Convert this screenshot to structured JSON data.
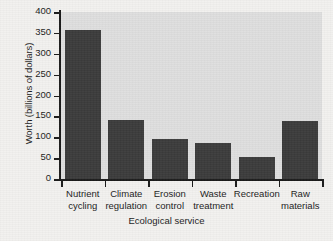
{
  "chart_data": {
    "type": "bar",
    "title": "",
    "xlabel": "Ecological service",
    "ylabel": "Worth (billions of dollars)",
    "categories": [
      "Nutrient cycling",
      "Climate regulation",
      "Erosion control",
      "Waste treatment",
      "Recreation",
      "Raw materials"
    ],
    "category_lines": [
      [
        "Nutrient",
        "cycling"
      ],
      [
        "Climate",
        "regulation"
      ],
      [
        "Erosion",
        "control"
      ],
      [
        "Waste",
        "treatment"
      ],
      [
        "Recreation",
        ""
      ],
      [
        "Raw",
        "materials"
      ]
    ],
    "values": [
      357,
      141,
      96,
      86,
      53,
      139
    ],
    "ylim": [
      0,
      400
    ],
    "yticks": [
      0,
      50,
      100,
      150,
      200,
      250,
      300,
      350,
      400
    ],
    "ytick_labels": [
      "0",
      "50",
      "100",
      "150",
      "200",
      "250",
      "300",
      "350",
      "400"
    ],
    "grid": false,
    "legend": null,
    "bar_color": "#3b3b3b",
    "plot_background": "#dedede",
    "axis_color": "#1a1a1a",
    "figure_background": "#f2f1ef"
  }
}
